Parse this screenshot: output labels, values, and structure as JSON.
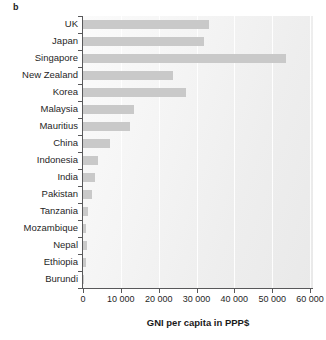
{
  "panel": {
    "label": "b"
  },
  "chart_data": {
    "type": "bar",
    "orientation": "horizontal",
    "title": "",
    "xlabel": "GNI per capita in PPP$",
    "ylabel": "",
    "xlim": [
      0,
      60000
    ],
    "grid": true,
    "legend": "none",
    "bar_color": "#c9c9c9",
    "axis_color": "#58585a",
    "plot_background": "#f2f2f2",
    "xticks": [
      0,
      10000,
      20000,
      30000,
      40000,
      50000,
      60000
    ],
    "xticklabels": [
      "0",
      "10 000",
      "20 000",
      "30 000",
      "40 000",
      "50 000",
      "60 000"
    ],
    "categories": [
      "UK",
      "Japan",
      "Singapore",
      "New Zealand",
      "Korea",
      "Malaysia",
      "Mauritius",
      "China",
      "Indonesia",
      "India",
      "Pakistan",
      "Tanzania",
      "Mozambique",
      "Nepal",
      "Ethiopia",
      "Burundi"
    ],
    "values": [
      33300,
      31900,
      53700,
      23800,
      27100,
      13500,
      12400,
      7100,
      3900,
      3200,
      2400,
      1300,
      800,
      1100,
      800,
      380
    ]
  }
}
